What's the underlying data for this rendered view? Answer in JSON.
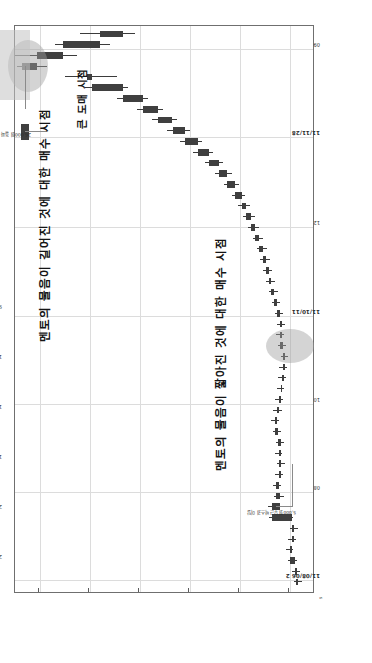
{
  "figure": {
    "id_label": "3S",
    "corner_mark": "s"
  },
  "chart_data": {
    "type": "candlestick",
    "title": "",
    "subtitle": "",
    "xlabel": "",
    "ylabel": "",
    "orientation": "rotated-90ccw",
    "grid": true,
    "legend": "none",
    "ylim": [
      7500,
      25500
    ],
    "ytick_labels": [
      "24,000",
      "21,000",
      "18,000",
      "15,000",
      "12,000",
      "9,000"
    ],
    "ytick_values": [
      24000,
      21000,
      18000,
      15000,
      12000,
      9000
    ],
    "xtick_labels": [
      "11/08/06 2",
      "08",
      "10",
      "11/10/11",
      "12",
      "11/11/28",
      "09"
    ],
    "series_name": "price",
    "colors": {
      "candle": "#3f3f3f",
      "wick": "#3b3b3b",
      "grid": "#dcdcdc",
      "axis": "#6f6f6f",
      "highlight_ellipse": "#a0a0a0",
      "callout_box": "#c3c3c3"
    },
    "candles": [
      {
        "i": 0,
        "open": 8520,
        "high": 8760,
        "low": 8300,
        "close": 8620
      },
      {
        "i": 1,
        "open": 8620,
        "high": 8900,
        "low": 8420,
        "close": 8700
      },
      {
        "i": 2,
        "open": 8700,
        "high": 9150,
        "low": 8560,
        "close": 9020
      },
      {
        "i": 3,
        "open": 9020,
        "high": 9240,
        "low": 8810,
        "close": 8900
      },
      {
        "i": 4,
        "open": 8900,
        "high": 9100,
        "low": 8640,
        "close": 8760
      },
      {
        "i": 5,
        "open": 8760,
        "high": 8980,
        "low": 8520,
        "close": 8880
      },
      {
        "i": 6,
        "open": 8880,
        "high": 10250,
        "low": 8800,
        "close": 10100
      },
      {
        "i": 7,
        "open": 10100,
        "high": 10300,
        "low": 9450,
        "close": 9600
      },
      {
        "i": 8,
        "open": 9600,
        "high": 9950,
        "low": 9380,
        "close": 9820
      },
      {
        "i": 9,
        "open": 9820,
        "high": 10050,
        "low": 9560,
        "close": 9680
      },
      {
        "i": 10,
        "open": 9680,
        "high": 9880,
        "low": 9400,
        "close": 9520
      },
      {
        "i": 11,
        "open": 9520,
        "high": 9780,
        "low": 9330,
        "close": 9660
      },
      {
        "i": 12,
        "open": 9660,
        "high": 9900,
        "low": 9480,
        "close": 9560
      },
      {
        "i": 13,
        "open": 9560,
        "high": 9840,
        "low": 9380,
        "close": 9700
      },
      {
        "i": 14,
        "open": 9700,
        "high": 10020,
        "low": 9520,
        "close": 9880
      },
      {
        "i": 15,
        "open": 9880,
        "high": 10120,
        "low": 9640,
        "close": 9760
      },
      {
        "i": 16,
        "open": 9760,
        "high": 10000,
        "low": 9500,
        "close": 9640
      },
      {
        "i": 17,
        "open": 9640,
        "high": 9880,
        "low": 9420,
        "close": 9560
      },
      {
        "i": 18,
        "open": 9560,
        "high": 9800,
        "low": 9340,
        "close": 9480
      },
      {
        "i": 19,
        "open": 9480,
        "high": 9720,
        "low": 9260,
        "close": 9400
      },
      {
        "i": 20,
        "open": 9400,
        "high": 9650,
        "low": 9180,
        "close": 9320
      },
      {
        "i": 21,
        "open": 9320,
        "high": 9560,
        "low": 9100,
        "close": 9440
      },
      {
        "i": 22,
        "open": 9440,
        "high": 9700,
        "low": 9220,
        "close": 9580
      },
      {
        "i": 23,
        "open": 9580,
        "high": 9820,
        "low": 9360,
        "close": 9500
      },
      {
        "i": 24,
        "open": 9500,
        "high": 9760,
        "low": 9280,
        "close": 9620
      },
      {
        "i": 25,
        "open": 9620,
        "high": 9900,
        "low": 9420,
        "close": 9780
      },
      {
        "i": 26,
        "open": 9780,
        "high": 10080,
        "low": 9580,
        "close": 9960
      },
      {
        "i": 27,
        "open": 9960,
        "high": 10250,
        "low": 9740,
        "close": 10120
      },
      {
        "i": 28,
        "open": 10120,
        "high": 10420,
        "low": 9900,
        "close": 10280
      },
      {
        "i": 29,
        "open": 10280,
        "high": 10600,
        "low": 10050,
        "close": 10440
      },
      {
        "i": 30,
        "open": 10440,
        "high": 10780,
        "low": 10200,
        "close": 10620
      },
      {
        "i": 31,
        "open": 10620,
        "high": 11000,
        "low": 10400,
        "close": 10860
      },
      {
        "i": 32,
        "open": 10860,
        "high": 11250,
        "low": 10620,
        "close": 11080
      },
      {
        "i": 33,
        "open": 11080,
        "high": 11500,
        "low": 10840,
        "close": 11340
      },
      {
        "i": 34,
        "open": 11340,
        "high": 11800,
        "low": 11100,
        "close": 11620
      },
      {
        "i": 35,
        "open": 11620,
        "high": 12100,
        "low": 11380,
        "close": 11900
      },
      {
        "i": 36,
        "open": 11900,
        "high": 12500,
        "low": 11680,
        "close": 12300
      },
      {
        "i": 37,
        "open": 12300,
        "high": 12980,
        "low": 12060,
        "close": 12760
      },
      {
        "i": 38,
        "open": 12760,
        "high": 13500,
        "low": 12500,
        "close": 13240
      },
      {
        "i": 39,
        "open": 13240,
        "high": 14100,
        "low": 13000,
        "close": 13860
      },
      {
        "i": 40,
        "open": 13860,
        "high": 14800,
        "low": 13600,
        "close": 14520
      },
      {
        "i": 41,
        "open": 14520,
        "high": 15600,
        "low": 14260,
        "close": 15280
      },
      {
        "i": 42,
        "open": 15280,
        "high": 16400,
        "low": 15000,
        "close": 16050
      },
      {
        "i": 43,
        "open": 16050,
        "high": 17300,
        "low": 15800,
        "close": 16900
      },
      {
        "i": 44,
        "open": 16900,
        "high": 18200,
        "low": 16600,
        "close": 17800
      },
      {
        "i": 45,
        "open": 17800,
        "high": 19400,
        "low": 17500,
        "close": 19000
      },
      {
        "i": 46,
        "open": 19000,
        "high": 21300,
        "low": 18700,
        "close": 20900
      },
      {
        "i": 47,
        "open": 20900,
        "high": 22500,
        "low": 19400,
        "close": 21200
      },
      {
        "i": 48,
        "open": 25100,
        "high": 25400,
        "low": 23600,
        "close": 24200
      },
      {
        "i": 49,
        "open": 24200,
        "high": 25500,
        "low": 21800,
        "close": 22600
      },
      {
        "i": 50,
        "open": 22600,
        "high": 23100,
        "low": 19800,
        "close": 20400
      },
      {
        "i": 51,
        "open": 20400,
        "high": 21600,
        "low": 18300,
        "close": 19000
      }
    ],
    "annotations": [
      {
        "id": "buy-point",
        "text": "멘토의 물음이 짧아진 것에 대한 매수 시점",
        "kind": "callout-label"
      },
      {
        "id": "warning-point",
        "text": "멘토의 물음이 길어진 것에 대한 매수 시점",
        "kind": "callout-label"
      },
      {
        "id": "sell-point",
        "text": "큰 도매 시점",
        "kind": "callout-label"
      },
      {
        "id": "price-breakout-note",
        "text": "26,000원 돌파 2011/11/22",
        "kind": "leader-note"
      },
      {
        "id": "lower-note",
        "text": "5,000원 부근 박스권 이탈",
        "kind": "leader-note"
      }
    ],
    "highlights": [
      {
        "id": "highlight-upper",
        "shape": "ellipse",
        "target": "breakout-candles"
      },
      {
        "id": "highlight-lower",
        "shape": "ellipse",
        "target": "accumulation-candles"
      }
    ]
  }
}
